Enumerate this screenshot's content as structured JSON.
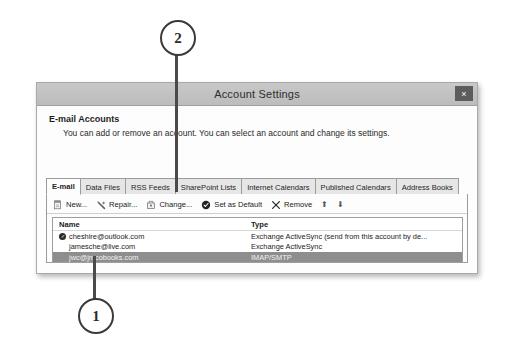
{
  "callouts": [
    {
      "label": "2",
      "name": "callout-marker-2"
    },
    {
      "label": "1",
      "name": "callout-marker-1"
    }
  ],
  "dialog": {
    "title": "Account Settings",
    "close_label": "×",
    "section": {
      "heading": "E-mail Accounts",
      "description": "You can add or remove an account. You can select an account and change its settings."
    },
    "tabs": [
      {
        "label": "E-mail",
        "active": true
      },
      {
        "label": "Data Files",
        "active": false
      },
      {
        "label": "RSS Feeds",
        "active": false
      },
      {
        "label": "SharePoint Lists",
        "active": false
      },
      {
        "label": "Internet Calendars",
        "active": false
      },
      {
        "label": "Published Calendars",
        "active": false
      },
      {
        "label": "Address Books",
        "active": false
      }
    ],
    "toolbar": {
      "new_label": "New...",
      "repair_label": "Repair...",
      "change_label": "Change...",
      "set_default_label": "Set as Default",
      "remove_label": "Remove",
      "move_up_label": "⬆",
      "move_down_label": "⬇"
    },
    "accounts_list": {
      "columns": [
        "Name",
        "Type"
      ],
      "rows": [
        {
          "name": "cheshire@outlook.com",
          "type": "Exchange ActiveSync (send from this account by de...",
          "is_default": true,
          "selected": false
        },
        {
          "name": "jamesche@live.com",
          "type": "Exchange ActiveSync",
          "is_default": false,
          "selected": false
        },
        {
          "name": "jwc@jmcobooks.com",
          "type": "IMAP/SMTP",
          "is_default": false,
          "selected": true
        }
      ]
    }
  }
}
